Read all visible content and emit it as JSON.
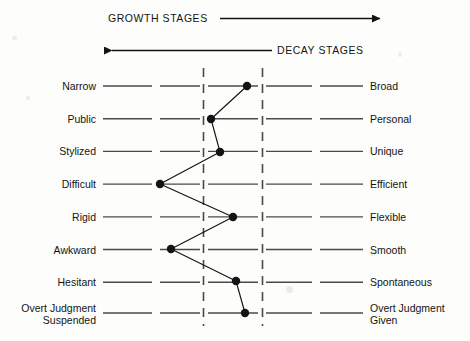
{
  "header": {
    "growth_label": "GROWTH STAGES",
    "decay_label": "DECAY STAGES"
  },
  "chart_data": {
    "type": "line",
    "title": "",
    "orientation": "horizontal-profile",
    "xlabel": "",
    "ylabel": "",
    "grid": false,
    "legend": "none",
    "xlim": [
      1,
      5
    ],
    "axis_note": "5 discrete tick segments per row; two dashed vertical guide lines between segment 2/3 and segment 4/5",
    "dashed_guides": [
      2.5,
      3.5
    ],
    "left_poles": [
      "Narrow",
      "Public",
      "Stylized",
      "Difficult",
      "Rigid",
      "Awkward",
      "Hesitant",
      "Overt Judgment Suspended"
    ],
    "right_poles": [
      "Broad",
      "Personal",
      "Unique",
      "Efficient",
      "Flexible",
      "Smooth",
      "Spontaneous",
      "Overt Judgment Given"
    ],
    "categories": [
      "Narrow-Broad",
      "Public-Personal",
      "Stylized-Unique",
      "Difficult-Efficient",
      "Rigid-Flexible",
      "Awkward-Smooth",
      "Hesitant-Spontaneous",
      "Overt Judgment Suspended-Given"
    ],
    "values": [
      3.3,
      2.6,
      2.8,
      1.5,
      3.1,
      1.7,
      3.2,
      3.3
    ],
    "points_px": [
      {
        "x": 247,
        "y": 86
      },
      {
        "x": 211,
        "y": 119
      },
      {
        "x": 220,
        "y": 152
      },
      {
        "x": 160,
        "y": 184
      },
      {
        "x": 233,
        "y": 217
      },
      {
        "x": 171,
        "y": 249
      },
      {
        "x": 236,
        "y": 281
      },
      {
        "x": 245,
        "y": 313
      }
    ]
  },
  "rows_left": [
    {
      "line1": "Narrow",
      "line2": ""
    },
    {
      "line1": "Public",
      "line2": ""
    },
    {
      "line1": "Stylized",
      "line2": ""
    },
    {
      "line1": "Difficult",
      "line2": ""
    },
    {
      "line1": "Rigid",
      "line2": ""
    },
    {
      "line1": "Awkward",
      "line2": ""
    },
    {
      "line1": "Hesitant",
      "line2": ""
    },
    {
      "line1": "Overt Judgment",
      "line2": "Suspended"
    }
  ],
  "rows_right": [
    {
      "line1": "Broad",
      "line2": ""
    },
    {
      "line1": "Personal",
      "line2": ""
    },
    {
      "line1": "Unique",
      "line2": ""
    },
    {
      "line1": "Efficient",
      "line2": ""
    },
    {
      "line1": "Flexible",
      "line2": ""
    },
    {
      "line1": "Smooth",
      "line2": ""
    },
    {
      "line1": "Spontaneous",
      "line2": ""
    },
    {
      "line1": "Overt Judgment",
      "line2": "Given"
    }
  ],
  "colors": {
    "ink": "#141414",
    "rule": "#4a4a4a",
    "dash": "#4a4a4a",
    "paper": "#fdfdfb"
  }
}
